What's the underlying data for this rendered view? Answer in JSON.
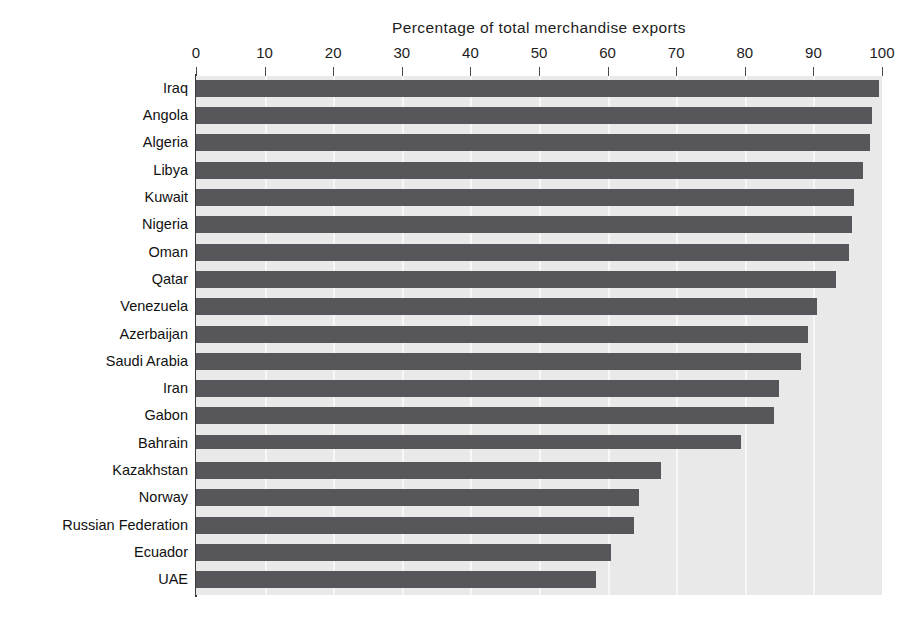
{
  "chart_data": {
    "type": "bar",
    "orientation": "horizontal",
    "title": "Percentage of total merchandise exports",
    "xlabel": "",
    "ylabel": "",
    "xlim": [
      0,
      100
    ],
    "xticks": [
      0,
      10,
      20,
      30,
      40,
      50,
      60,
      70,
      80,
      90,
      100
    ],
    "xtick_labels": [
      "0",
      "10",
      "20",
      "30",
      "40",
      "50",
      "60",
      "70",
      "80",
      "90",
      "100"
    ],
    "grid": true,
    "grid_axis": "x",
    "legend": false,
    "legend_position": "none",
    "bar_color": "#56565b",
    "plot_background": "#e9e9e9",
    "gridline_color": "#f7f7f7",
    "categories": [
      "Iraq",
      "Angola",
      "Algeria",
      "Libya",
      "Kuwait",
      "Nigeria",
      "Oman",
      "Qatar",
      "Venezuela",
      "Azerbaijan",
      "Saudi Arabia",
      "Iran",
      "Gabon",
      "Bahrain",
      "Kazakhstan",
      "Norway",
      "Russian Federation",
      "Ecuador",
      "UAE"
    ],
    "values": [
      99.5,
      98.5,
      98.3,
      97.3,
      95.9,
      95.6,
      95.2,
      93.3,
      90.5,
      89.2,
      88.2,
      85.0,
      84.3,
      79.5,
      67.8,
      64.6,
      63.9,
      60.5,
      58.3
    ]
  }
}
